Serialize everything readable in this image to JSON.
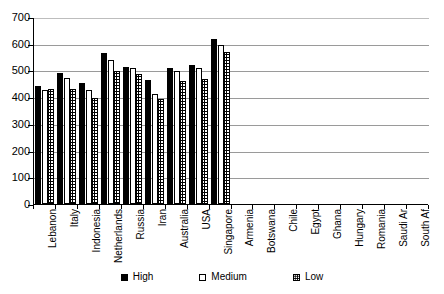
{
  "chart_data": {
    "type": "bar",
    "title": "",
    "subtitle": "",
    "xlabel": "",
    "ylabel": "",
    "ylim": [
      0,
      700
    ],
    "y_ticks": [
      0,
      100,
      200,
      300,
      400,
      500,
      600,
      700
    ],
    "grid": true,
    "legend_position": "bottom",
    "orientation": "vertical",
    "grouping": "clustered",
    "categories": [
      "Lebanon",
      "Italy",
      "Indonesia",
      "Netherlands",
      "Russia",
      "Iran",
      "Australia",
      "USA",
      "Singapore",
      "Armenia",
      "Botswana",
      "Chile",
      "Egypt",
      "Ghana",
      "Hungary",
      "Romania",
      "Saudi Ar",
      "South Af"
    ],
    "series": [
      {
        "name": "High",
        "color": "#000000",
        "fill": "solid-black",
        "values": [
          440,
          490,
          453,
          565,
          513,
          463,
          508,
          520,
          618,
          0,
          0,
          0,
          0,
          0,
          0,
          0,
          0,
          0
        ]
      },
      {
        "name": "Medium",
        "color": "#ffffff",
        "fill": "white-outline",
        "values": [
          428,
          473,
          425,
          540,
          510,
          410,
          498,
          508,
          595,
          0,
          0,
          0,
          0,
          0,
          0,
          0,
          0,
          0
        ]
      },
      {
        "name": "Low",
        "color": "#ffffff",
        "fill": "dotted-pattern",
        "values": [
          432,
          430,
          395,
          498,
          487,
          392,
          462,
          467,
          570,
          0,
          0,
          0,
          0,
          0,
          0,
          0,
          0,
          0
        ]
      }
    ]
  },
  "axes": {
    "y_tick_labels": [
      "700",
      "600",
      "500",
      "400",
      "300",
      "200",
      "100",
      "0"
    ]
  },
  "legend": {
    "items": [
      {
        "label": "High",
        "swatch": "solid-black-square"
      },
      {
        "label": "Medium",
        "swatch": "white-square"
      },
      {
        "label": "Low",
        "swatch": "dotted-square"
      }
    ]
  }
}
